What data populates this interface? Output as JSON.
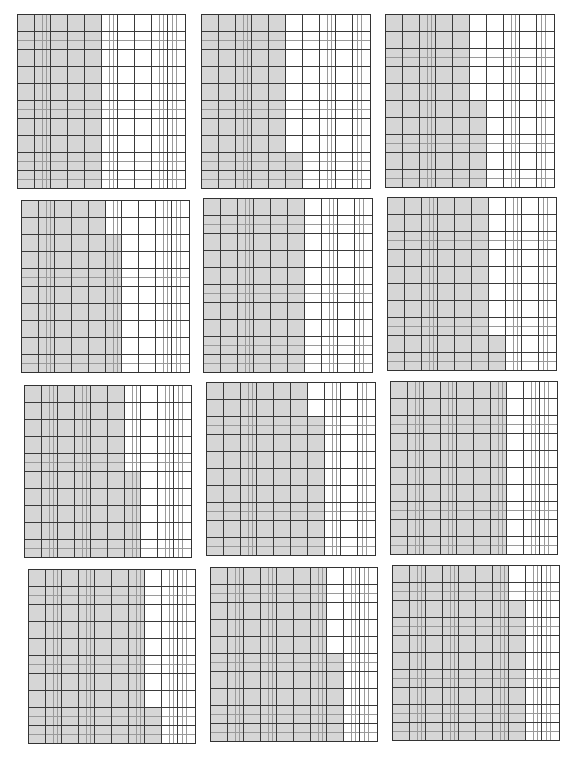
{
  "page": {
    "shade_color": "#d6d6d6",
    "line_color": "#3a3a3a"
  },
  "grids": [
    {
      "id": 1,
      "full_columns": 5,
      "partial_rows": 0,
      "shaded": 50,
      "x": 17,
      "y": 14,
      "w": 169,
      "h": 175
    },
    {
      "id": 2,
      "full_columns": 5,
      "partial_rows": 2,
      "shaded": 52,
      "x": 201,
      "y": 14,
      "w": 170,
      "h": 175
    },
    {
      "id": 3,
      "full_columns": 5,
      "partial_rows": 5,
      "shaded": 55,
      "x": 385,
      "y": 14,
      "w": 170,
      "h": 174
    },
    {
      "id": 4,
      "full_columns": 5,
      "partial_rows": 8,
      "shaded": 58,
      "x": 21,
      "y": 200,
      "w": 169,
      "h": 173
    },
    {
      "id": 5,
      "full_columns": 6,
      "partial_rows": 0,
      "shaded": 60,
      "x": 203,
      "y": 198,
      "w": 170,
      "h": 175
    },
    {
      "id": 6,
      "full_columns": 6,
      "partial_rows": 2,
      "shaded": 62,
      "x": 387,
      "y": 197,
      "w": 170,
      "h": 174
    },
    {
      "id": 7,
      "full_columns": 6,
      "partial_rows": 5,
      "shaded": 65,
      "x": 24,
      "y": 385,
      "w": 168,
      "h": 173
    },
    {
      "id": 8,
      "full_columns": 6,
      "partial_rows": 8,
      "shaded": 68,
      "x": 206,
      "y": 382,
      "w": 170,
      "h": 174
    },
    {
      "id": 9,
      "full_columns": 7,
      "partial_rows": 0,
      "shaded": 70,
      "x": 390,
      "y": 381,
      "w": 168,
      "h": 174
    },
    {
      "id": 10,
      "full_columns": 7,
      "partial_rows": 2,
      "shaded": 72,
      "x": 28,
      "y": 569,
      "w": 168,
      "h": 175
    },
    {
      "id": 11,
      "full_columns": 7,
      "partial_rows": 5,
      "shaded": 75,
      "x": 210,
      "y": 567,
      "w": 168,
      "h": 175
    },
    {
      "id": 12,
      "full_columns": 7,
      "partial_rows": 8,
      "shaded": 78,
      "x": 392,
      "y": 565,
      "w": 168,
      "h": 176
    }
  ]
}
